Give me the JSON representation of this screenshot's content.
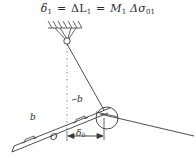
{
  "figure": {
    "title_formula": {
      "lhs": "δ",
      "lhs_sub": "1",
      "eq1": "=",
      "mid": "ΔL",
      "mid_sub": "1",
      "eq2": "=",
      "rhs_m": "M",
      "rhs_m_sub": "1",
      "rhs_delta": "Δσ",
      "rhs_delta_sub": "01"
    },
    "labels": {
      "bar_left": "b",
      "bar_right": "b",
      "dash_prefix": "-",
      "origin": "O",
      "dimension": "δ",
      "dimension_sub": "0"
    },
    "colors": {
      "stroke": "#3a3a3a",
      "text": "#2b2b2b",
      "background": "#ffffff"
    }
  }
}
